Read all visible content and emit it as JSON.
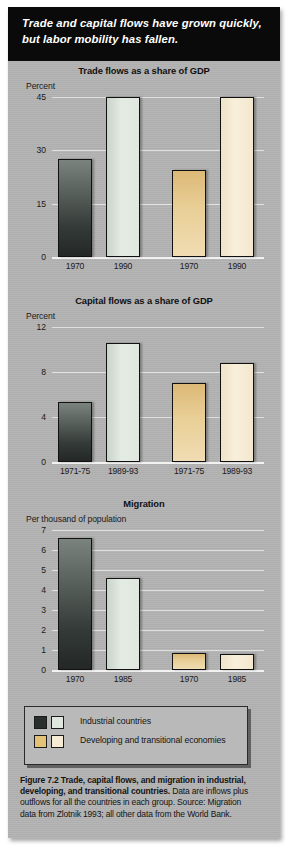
{
  "banner": {
    "text": "Trade and capital flows have grown quickly, but labor mobility has fallen."
  },
  "legend": {
    "items": [
      {
        "label": "Industrial countries",
        "swatch_a": "#2a2f2d",
        "swatch_b": "#dfe7de"
      },
      {
        "label": "Developing and transitional economies",
        "swatch_a": "#e3c176",
        "swatch_b": "#f6ecd6"
      }
    ]
  },
  "caption": {
    "bold": "Figure 7.2  Trade, capital flows, and migration in industrial, developing, and transitional countries.",
    "rest": " Data are inflows plus outflows for all the countries in each group.  Source: Migration data from Zlotnik 1993; all other data from the World Bank."
  },
  "colors": {
    "panel": "#b3b3b3",
    "banner": "#0a0a0a",
    "industrial_1970": "#2a2f2d",
    "industrial_later": "#dfe7de",
    "developing_1970": "#e3c176",
    "developing_later": "#f6ecd6",
    "gridline": "#e9e9e9"
  },
  "chart_data": [
    {
      "type": "bar",
      "title": "Trade flows as a share of GDP",
      "ylabel": "Percent",
      "xlabel": "",
      "ylim": [
        0,
        45
      ],
      "yticks": [
        0,
        15,
        30,
        45
      ],
      "ytick_labels": [
        "0",
        "15",
        "30",
        "45"
      ],
      "grid": true,
      "categories": [
        "1970",
        "1990",
        "1970",
        "1990"
      ],
      "groups": [
        "Industrial countries",
        "Industrial countries",
        "Developing and transitional economies",
        "Developing and transitional economies"
      ],
      "values": [
        27.5,
        45.0,
        24.5,
        45.0
      ],
      "bar_styles": [
        "dark",
        "lightgreen",
        "tan",
        "cream"
      ]
    },
    {
      "type": "bar",
      "title": "Capital flows as a share of GDP",
      "ylabel": "Percent",
      "xlabel": "",
      "ylim": [
        0,
        12
      ],
      "yticks": [
        0,
        4,
        8,
        12
      ],
      "ytick_labels": [
        "0",
        "4",
        "8",
        "12"
      ],
      "grid": true,
      "categories": [
        "1971-75",
        "1989-93",
        "1971-75",
        "1989-93"
      ],
      "groups": [
        "Industrial countries",
        "Industrial countries",
        "Developing and transitional economies",
        "Developing and transitional economies"
      ],
      "values": [
        5.3,
        10.6,
        7.0,
        8.8
      ],
      "bar_styles": [
        "dark",
        "lightgreen",
        "tan",
        "cream"
      ]
    },
    {
      "type": "bar",
      "title": "Migration",
      "ylabel": "Per thousand of population",
      "xlabel": "",
      "ylim": [
        0,
        7
      ],
      "yticks": [
        0,
        1,
        2,
        3,
        4,
        5,
        6,
        7
      ],
      "ytick_labels": [
        "0",
        "1",
        "2",
        "3",
        "4",
        "5",
        "6",
        "7"
      ],
      "grid": true,
      "categories": [
        "1970",
        "1985",
        "1970",
        "1985"
      ],
      "groups": [
        "Industrial countries",
        "Industrial countries",
        "Developing and transitional economies",
        "Developing and transitional economies"
      ],
      "values": [
        6.6,
        4.6,
        0.85,
        0.8
      ],
      "bar_styles": [
        "dark",
        "lightgreen",
        "tan",
        "cream"
      ]
    }
  ]
}
